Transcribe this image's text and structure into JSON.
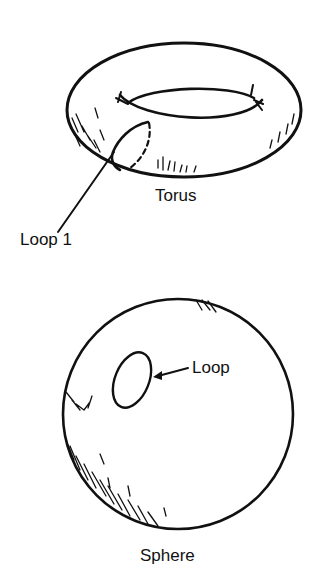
{
  "figure": {
    "torus": {
      "label": "Torus",
      "loop_label": "Loop 1"
    },
    "sphere": {
      "label": "Sphere",
      "loop_label": "Loop"
    },
    "colors": {
      "ink": "#111111",
      "background": "#ffffff"
    }
  }
}
